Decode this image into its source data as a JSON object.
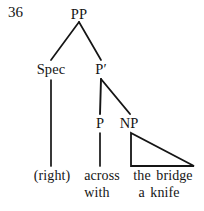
{
  "figure": {
    "example_number": "36"
  },
  "nodes": {
    "root": {
      "label": "PP",
      "x": 79,
      "y": 14
    },
    "spec": {
      "label": "Spec",
      "x": 51,
      "y": 69
    },
    "pbar": {
      "label": "P′",
      "x": 101,
      "y": 69
    },
    "p": {
      "label": "P",
      "x": 100,
      "y": 123
    },
    "np": {
      "label": "NP",
      "x": 129,
      "y": 123
    }
  },
  "terminals": {
    "spec_line1": {
      "label": "(right)",
      "x": 52,
      "y": 176
    },
    "p_line1": {
      "label": "across",
      "x": 102,
      "y": 176
    },
    "p_line2": {
      "label": "with",
      "x": 97,
      "y": 193
    },
    "np_line1": {
      "label": "the bridge",
      "x": 163,
      "y": 176
    },
    "np_line2": {
      "label": "a knife",
      "x": 159,
      "y": 193
    }
  },
  "edges": {
    "stroke_color": "#151515",
    "root_to_spec": {
      "x1": 79,
      "y1": 22,
      "x2": 51,
      "y2": 60
    },
    "root_to_pbar": {
      "x1": 79,
      "y1": 22,
      "x2": 101,
      "y2": 60
    },
    "pbar_to_p": {
      "x1": 101,
      "y1": 79,
      "x2": 100,
      "y2": 114
    },
    "pbar_to_np": {
      "x1": 101,
      "y1": 79,
      "x2": 130,
      "y2": 114
    },
    "spec_to_terminal": {
      "x1": 51,
      "y1": 79,
      "x2": 51,
      "y2": 166
    },
    "p_to_terminal": {
      "x1": 100,
      "y1": 133,
      "x2": 100,
      "y2": 166
    }
  },
  "np_triangle": {
    "apex": {
      "x": 131,
      "y": 133
    },
    "bottom_left": {
      "x": 131,
      "y": 166
    },
    "bottom_right": {
      "x": 194,
      "y": 166
    }
  },
  "colors": {
    "background": "#ffffff",
    "ink": "#151515"
  }
}
